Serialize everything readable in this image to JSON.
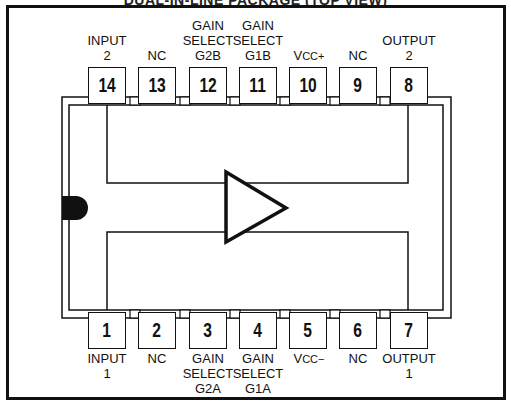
{
  "title": "DUAL-IN-LINE PACKAGE (TOP VIEW)",
  "colors": {
    "line": "#111111",
    "background": "#ffffff",
    "notch": "#111111"
  },
  "package": {
    "notch": "filled-semicircle-left",
    "symbol": "amplifier-triangle"
  },
  "top_pins": [
    {
      "number": "14",
      "label": "INPUT\n2"
    },
    {
      "number": "13",
      "label": "NC"
    },
    {
      "number": "12",
      "label": "GAIN\nSELECT\nG2B"
    },
    {
      "number": "11",
      "label": "GAIN\nSELECT\nG1B"
    },
    {
      "number": "10",
      "label_main": "V",
      "label_sub": "CC+"
    },
    {
      "number": "9",
      "label": "NC"
    },
    {
      "number": "8",
      "label": "OUTPUT\n2"
    }
  ],
  "bottom_pins": [
    {
      "number": "1",
      "label": "INPUT\n1"
    },
    {
      "number": "2",
      "label": "NC"
    },
    {
      "number": "3",
      "label": "GAIN\nSELECT\nG2A"
    },
    {
      "number": "4",
      "label": "GAIN\nSELECT\nG1A"
    },
    {
      "number": "5",
      "label_main": "V",
      "label_sub": "CC−"
    },
    {
      "number": "6",
      "label": "NC"
    },
    {
      "number": "7",
      "label": "OUTPUT\n1"
    }
  ]
}
